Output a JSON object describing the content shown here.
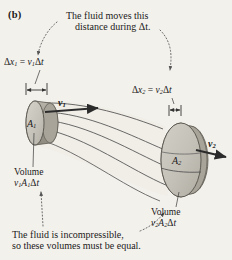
{
  "figure": {
    "panel_label": "(b)",
    "background_color": "#f3f1ec",
    "ink_color": "#1a1a1a"
  },
  "annotations": {
    "top": {
      "line1": "The fluid moves this",
      "line2": "distance during Δt."
    },
    "bottom": {
      "line1": "The fluid is incompressible,",
      "line2": "so these volumes must be equal."
    }
  },
  "labels": {
    "displacement_left": {
      "lhs": "Δx",
      "lhs_sub": "1",
      "eq": "=",
      "rhs_v": "v",
      "rhs_sub": "1",
      "rhs_tail": "Δt",
      "full": "Δx₁ = v₁Δt"
    },
    "displacement_right": {
      "lhs": "Δx",
      "lhs_sub": "2",
      "eq": "=",
      "rhs_v": "v",
      "rhs_sub": "2",
      "rhs_tail": "Δt",
      "full": "Δx₂ = v₂Δt"
    },
    "volume_left": {
      "title": "Volume",
      "expr_v": "v",
      "expr_v_sub": "1",
      "expr_a": "A",
      "expr_a_sub": "1",
      "expr_tail": "Δt",
      "full": "v₁A₁Δt"
    },
    "volume_right": {
      "title": "Volume",
      "expr_v": "v",
      "expr_v_sub": "2",
      "expr_a": "A",
      "expr_a_sub": "2",
      "expr_tail": "Δt",
      "full": "v₂A₂Δt"
    },
    "area_left": {
      "symbol": "A",
      "sub": "1"
    },
    "area_right": {
      "symbol": "A",
      "sub": "2"
    },
    "velocity_left": {
      "symbol": "v",
      "sub": "1"
    },
    "velocity_right": {
      "symbol": "v",
      "sub": "2"
    }
  },
  "diagram": {
    "tube_fill": "#efece6",
    "disc_face_color": "#c9c6bd",
    "disc_side_color": "#a9a59b",
    "ellipse_face_color": "#c9c6bd",
    "ellipse_side_color": "#a8a49a",
    "streamline_color": "#4b4b4b",
    "arrow_color": "#2b2b2b",
    "leader_color": "#555555",
    "left_disc": {
      "cx": 35,
      "cy": 123,
      "rx": 9,
      "ry": 22,
      "depth": 20
    },
    "right_ellipse": {
      "cx": 181,
      "cy": 160,
      "rx": 20,
      "ry": 37,
      "depth": 11
    },
    "bracket_left": {
      "x1": 26,
      "x2": 47,
      "y": 90
    },
    "bracket_right": {
      "x1": 170,
      "x2": 181,
      "y": 110
    },
    "streamline_count": 5
  }
}
